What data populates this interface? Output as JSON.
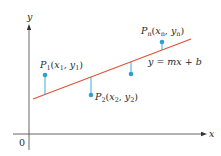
{
  "diagram": {
    "axes": {
      "x_label": "x",
      "y_label": "y",
      "origin_label": "0"
    },
    "line": {
      "equation": "y = mx + b",
      "color": "#e0533a"
    },
    "point_color": "#2b9fd6",
    "points": [
      {
        "name": "P",
        "sub": "1",
        "coords_x": "x",
        "coords_xsub": "1",
        "coords_y": "y",
        "coords_ysub": "1"
      },
      {
        "name": "P",
        "sub": "2",
        "coords_x": "x",
        "coords_xsub": "2",
        "coords_y": "y",
        "coords_ysub": "2"
      },
      {
        "name": "P",
        "sub": "n",
        "coords_x": "x",
        "coords_xsub": "n",
        "coords_y": "y",
        "coords_ysub": "n"
      }
    ]
  }
}
